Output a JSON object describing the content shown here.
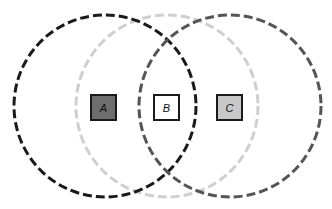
{
  "diagram": {
    "type": "venn",
    "circles": [
      {
        "id": "circle-a",
        "cx": 105,
        "cy": 106,
        "r": 91,
        "color": "#1a1a1a",
        "style": "dashed"
      },
      {
        "id": "circle-b",
        "cx": 167,
        "cy": 106,
        "r": 91,
        "color": "#cfcfcf",
        "style": "dashed"
      },
      {
        "id": "circle-c",
        "cx": 230,
        "cy": 106,
        "r": 91,
        "color": "#555555",
        "style": "dashed"
      }
    ],
    "squares": [
      {
        "id": "A",
        "label": "A",
        "x": 91,
        "y": 95,
        "size": 25,
        "fill": "#6e6e6e",
        "stroke": "#1a1a1a"
      },
      {
        "id": "B",
        "label": "B",
        "x": 154,
        "y": 95,
        "size": 25,
        "fill": "#ffffff",
        "stroke": "#1a1a1a"
      },
      {
        "id": "C",
        "label": "C",
        "x": 217,
        "y": 95,
        "size": 25,
        "fill": "#c8c8c8",
        "stroke": "#1a1a1a"
      }
    ]
  },
  "labels": {
    "a": "A",
    "b": "B",
    "c": "C"
  }
}
